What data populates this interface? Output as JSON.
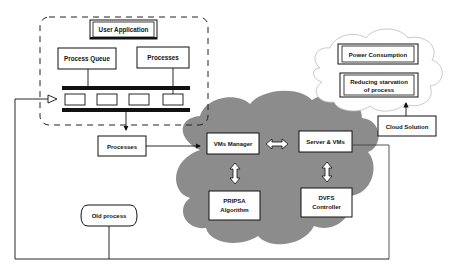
{
  "diagram": {
    "user_application": "User Application",
    "process_queue": "Process Queue",
    "processes_top": "Processes",
    "processes_mid": "Processes",
    "old_process": "Old process",
    "vms_manager": "VMs Manager",
    "server_vms": "Server & VMs",
    "pripsa_line1": "PRIPSA",
    "pripsa_line2": "Algorithm",
    "dvfs_line1": "DVFS",
    "dvfs_line2": "Controller",
    "power_consumption": "Power Consumption",
    "reducing_line1": "Reducing starvation",
    "reducing_line2": "of process",
    "cloud_solution": "Cloud Solution"
  },
  "colors": {
    "cloud_fill": "#8c8c8c",
    "outline_cloud": "#bbbbbb",
    "stroke": "#111111"
  }
}
